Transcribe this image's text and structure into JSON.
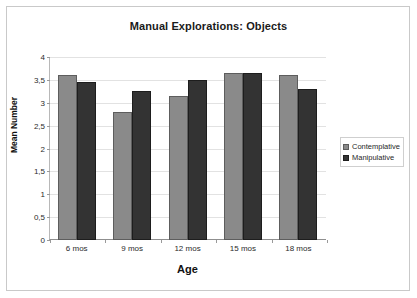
{
  "chart_data": {
    "type": "bar",
    "title": "Manual Explorations: Objects",
    "xlabel": "Age",
    "ylabel": "Mean Number",
    "categories": [
      "6 mos",
      "9 mos",
      "12 mos",
      "15 mos",
      "18 mos"
    ],
    "series": [
      {
        "name": "Contemplative",
        "color": "#8a8a8a",
        "values": [
          3.6,
          2.8,
          3.15,
          3.65,
          3.6
        ]
      },
      {
        "name": "Manipulative",
        "color": "#333333",
        "values": [
          3.45,
          3.25,
          3.5,
          3.65,
          3.3
        ]
      }
    ],
    "ylim": [
      0,
      4
    ],
    "ytick_labels": [
      "4",
      "3,5",
      "3",
      "2,5",
      "2",
      "1,5",
      "1",
      "0,5",
      "0"
    ],
    "ytick_values": [
      4,
      3.5,
      3,
      2.5,
      2,
      1.5,
      1,
      0.5,
      0
    ],
    "grid": true,
    "legend_position": "right"
  }
}
